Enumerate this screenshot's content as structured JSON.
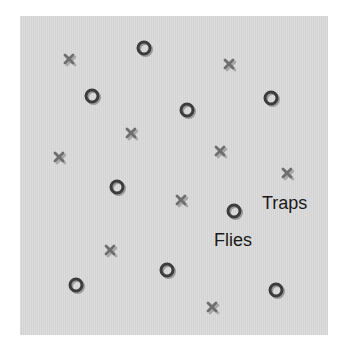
{
  "diagram": {
    "background_color": "#dadada",
    "labels": {
      "traps": "Traps",
      "flies": "Flies"
    },
    "legend_positions": {
      "traps": {
        "x": 262,
        "y": 194
      },
      "flies": {
        "x": 214,
        "y": 231
      }
    },
    "traps": [
      {
        "x": 70,
        "y": 60
      },
      {
        "x": 230,
        "y": 65
      },
      {
        "x": 132,
        "y": 134
      },
      {
        "x": 60,
        "y": 158
      },
      {
        "x": 221,
        "y": 152
      },
      {
        "x": 288,
        "y": 174
      },
      {
        "x": 182,
        "y": 201
      },
      {
        "x": 111,
        "y": 251
      },
      {
        "x": 213,
        "y": 308
      }
    ],
    "flies": [
      {
        "x": 144,
        "y": 48
      },
      {
        "x": 92,
        "y": 96
      },
      {
        "x": 187,
        "y": 110
      },
      {
        "x": 271,
        "y": 98
      },
      {
        "x": 117,
        "y": 187
      },
      {
        "x": 234,
        "y": 211
      },
      {
        "x": 167,
        "y": 270
      },
      {
        "x": 76,
        "y": 285
      },
      {
        "x": 276,
        "y": 290
      }
    ],
    "colors": {
      "fly_ring": "#3c3c3c",
      "fly_shadow": "#9a9a9a",
      "trap_cross": "#6e6e6e",
      "trap_shadow": "#a8a8a8"
    }
  }
}
